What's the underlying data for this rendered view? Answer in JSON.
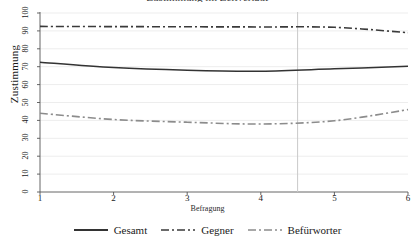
{
  "chart_data": {
    "type": "line",
    "title": "Zustimmung im Zeitverlauf",
    "xlabel": "Befragung",
    "ylabel": "Zustimmung",
    "x": [
      1,
      2,
      3,
      4,
      5,
      6
    ],
    "xlim": [
      1,
      6
    ],
    "ylim": [
      0,
      100
    ],
    "yticks": [
      0,
      10,
      20,
      30,
      40,
      50,
      60,
      70,
      80,
      90,
      100
    ],
    "xticks": [
      1,
      2,
      3,
      4,
      5,
      6
    ],
    "grid": "horizontal-light",
    "legend_position": "bottom-center",
    "annotations": [
      {
        "type": "vline",
        "x": 4.5,
        "color": "#c9c9c9",
        "label": ""
      }
    ],
    "series": [
      {
        "name": "Gesamt",
        "style": "solid",
        "color": "#333333",
        "values": [
          72.5,
          69.5,
          68.0,
          67.5,
          68.8,
          70.2
        ]
      },
      {
        "name": "Gegner",
        "style": "dash-dot",
        "color": "#3a3a3a",
        "values": [
          92.5,
          92.4,
          92.3,
          92.2,
          92.0,
          89.0
        ]
      },
      {
        "name": "Befürworter",
        "style": "dash-dot",
        "color": "#8c8c8c",
        "values": [
          44.0,
          40.5,
          39.0,
          38.0,
          39.8,
          46.0
        ]
      }
    ]
  },
  "axes": {
    "y_tick_labels": [
      "0",
      "10",
      "20",
      "30",
      "40",
      "50",
      "60",
      "70",
      "80",
      "90",
      "100"
    ],
    "x_tick_labels": [
      "1",
      "2",
      "3",
      "4",
      "5",
      "6"
    ],
    "y_title": "Zustimmung",
    "x_title": "Befragung"
  },
  "legend": {
    "items": [
      {
        "label": "Gesamt",
        "style": "solid",
        "color": "#333333"
      },
      {
        "label": "Gegner",
        "style": "dash-dot",
        "color": "#3a3a3a"
      },
      {
        "label": "Befürworter",
        "style": "dash-dot",
        "color": "#8c8c8c"
      }
    ]
  },
  "title": "Zustimmung im Zeitverlauf"
}
